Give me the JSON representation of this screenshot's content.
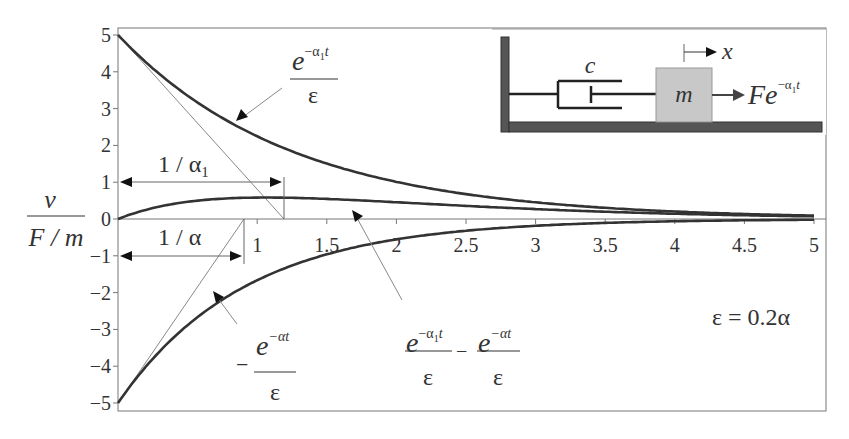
{
  "chart_data": {
    "type": "line",
    "title": "",
    "xlabel": "",
    "ylabel": "v / (F / m)",
    "xlim": [
      0,
      5
    ],
    "ylim": [
      -5,
      5
    ],
    "x_ticks": [
      "1",
      "1.5",
      "2",
      "2.5",
      "3",
      "3.5",
      "4",
      "4.5",
      "5"
    ],
    "y_ticks": [
      "5",
      "4",
      "3",
      "2",
      "1",
      "0",
      "-1",
      "-2",
      "-3",
      "-4",
      "-5"
    ],
    "grid": false,
    "parameters": {
      "alpha1": 0.8,
      "alpha": 1.1,
      "inv_epsilon": 5
    },
    "series": [
      {
        "name": "e^(-α1 t) / ε",
        "x": [
          0,
          0.5,
          1,
          1.5,
          2,
          2.5,
          3,
          3.5,
          4,
          4.5,
          5
        ],
        "values": [
          5.0,
          3.35,
          2.25,
          1.51,
          1.01,
          0.68,
          0.45,
          0.3,
          0.2,
          0.14,
          0.09
        ]
      },
      {
        "name": "e^(-α1 t)/ε − e^(-α t)/ε",
        "x": [
          0,
          0.5,
          1,
          1.5,
          2,
          2.5,
          3,
          3.5,
          4,
          4.5,
          5
        ],
        "values": [
          0.0,
          0.47,
          0.58,
          0.55,
          0.46,
          0.36,
          0.27,
          0.19,
          0.14,
          0.1,
          0.07
        ]
      },
      {
        "name": "−e^(-α t) / ε",
        "x": [
          0,
          0.5,
          1,
          1.5,
          2,
          2.5,
          3,
          3.5,
          4,
          4.5,
          5
        ],
        "values": [
          -5.0,
          -2.88,
          -1.66,
          -0.96,
          -0.55,
          -0.32,
          -0.18,
          -0.11,
          -0.06,
          -0.04,
          -0.02
        ]
      }
    ],
    "annotations": [
      {
        "text": "1 / α1",
        "type": "dimension",
        "from": 0,
        "to": 1.2,
        "y": 1
      },
      {
        "text": "1 / α",
        "type": "dimension",
        "from": 0,
        "to": 0.9,
        "y": -1
      },
      {
        "text": "ε = 0.2α"
      }
    ]
  },
  "labels": {
    "y_num": "v",
    "y_den": "F / m",
    "upper_num_base": "e",
    "upper_num_exp": "−α",
    "upper_num_sub": "1",
    "upper_num_t": "t",
    "upper_den": "ε",
    "lower_sign": "−",
    "lower_num_base": "e",
    "lower_num_exp": "−αt",
    "lower_den": "ε",
    "mid_minus": "−",
    "dim_alpha1": "1 / α",
    "dim_alpha1_sub": "1",
    "dim_alpha": "1 / α",
    "eps_relation": "ε = 0.2α"
  },
  "inset": {
    "damper_label": "c",
    "mass_label": "m",
    "disp_label": "x",
    "force_base": "Fe",
    "force_exp": "−α",
    "force_sub": "1",
    "force_t": "t"
  }
}
